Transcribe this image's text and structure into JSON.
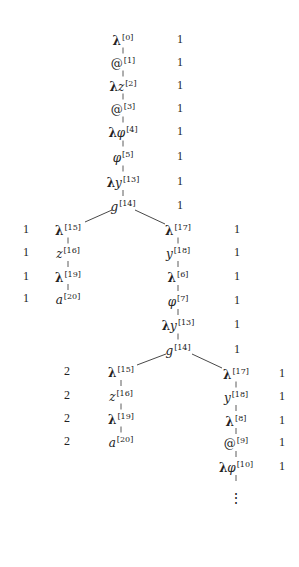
{
  "diagram": {
    "type": "tree",
    "nodes": [
      {
        "id": "n0",
        "lam": "λ",
        "sym": "",
        "idx": "[0]",
        "x": 123,
        "y": 39,
        "count": "1",
        "cx": 180
      },
      {
        "id": "n1",
        "lam": "",
        "sym": "@",
        "idx": "[1]",
        "x": 123,
        "y": 62,
        "count": "1",
        "cx": 180,
        "plain": true
      },
      {
        "id": "n2",
        "lam": "λ",
        "sym": "z",
        "idx": "[2]",
        "x": 123,
        "y": 85,
        "count": "1",
        "cx": 180
      },
      {
        "id": "n3",
        "lam": "",
        "sym": "@",
        "idx": "[3]",
        "x": 123,
        "y": 108,
        "count": "1",
        "cx": 180,
        "plain": true
      },
      {
        "id": "n4",
        "lam": "λ",
        "sym": "φ",
        "idx": "[4]",
        "x": 123,
        "y": 131,
        "count": "1",
        "cx": 180
      },
      {
        "id": "n5",
        "lam": "",
        "sym": "φ",
        "idx": "[5]",
        "x": 123,
        "y": 156,
        "count": "1",
        "cx": 180
      },
      {
        "id": "n6",
        "lam": "λ",
        "sym": "y",
        "idx": "[13]",
        "x": 123,
        "y": 181,
        "count": "1",
        "cx": 180
      },
      {
        "id": "n7",
        "lam": "",
        "sym": "g",
        "idx": "[14]",
        "x": 123,
        "y": 205,
        "count": "1",
        "cx": 180
      },
      {
        "id": "l0",
        "lam": "λ",
        "sym": "",
        "idx": "[15]",
        "x": 68,
        "y": 229,
        "count": "1",
        "cx": 26
      },
      {
        "id": "l1",
        "lam": "",
        "sym": "z",
        "idx": "[16]",
        "x": 68,
        "y": 252,
        "count": "1",
        "cx": 26
      },
      {
        "id": "l2",
        "lam": "λ",
        "sym": "",
        "idx": "[19]",
        "x": 68,
        "y": 276,
        "count": "1",
        "cx": 26
      },
      {
        "id": "l3",
        "lam": "",
        "sym": "a",
        "idx": "[20]",
        "x": 68,
        "y": 298,
        "count": "1",
        "cx": 26
      },
      {
        "id": "r0",
        "lam": "λ",
        "sym": "",
        "idx": "[17]",
        "x": 178,
        "y": 229,
        "count": "1",
        "cx": 237
      },
      {
        "id": "r1",
        "lam": "",
        "sym": "y",
        "idx": "[18]",
        "x": 178,
        "y": 252,
        "count": "1",
        "cx": 237
      },
      {
        "id": "r2",
        "lam": "λ",
        "sym": "",
        "idx": "[6]",
        "x": 178,
        "y": 276,
        "count": "1",
        "cx": 237
      },
      {
        "id": "r3",
        "lam": "",
        "sym": "φ",
        "idx": "[7]",
        "x": 178,
        "y": 300,
        "count": "1",
        "cx": 237
      },
      {
        "id": "r4",
        "lam": "λ",
        "sym": "y",
        "idx": "[13]",
        "x": 178,
        "y": 324,
        "count": "1",
        "cx": 237
      },
      {
        "id": "r5",
        "lam": "",
        "sym": "g",
        "idx": "[14]",
        "x": 178,
        "y": 349,
        "count": "1",
        "cx": 237
      },
      {
        "id": "rl0",
        "lam": "λ",
        "sym": "",
        "idx": "[15]",
        "x": 121,
        "y": 371,
        "count": "2",
        "cx": 67
      },
      {
        "id": "rl1",
        "lam": "",
        "sym": "z",
        "idx": "[16]",
        "x": 121,
        "y": 395,
        "count": "2",
        "cx": 67
      },
      {
        "id": "rl2",
        "lam": "λ",
        "sym": "",
        "idx": "[19]",
        "x": 121,
        "y": 418,
        "count": "2",
        "cx": 67
      },
      {
        "id": "rl3",
        "lam": "",
        "sym": "a",
        "idx": "[20]",
        "x": 121,
        "y": 441,
        "count": "2",
        "cx": 67
      },
      {
        "id": "rr0",
        "lam": "λ",
        "sym": "",
        "idx": "[17]",
        "x": 236,
        "y": 373,
        "count": "1",
        "cx": 282
      },
      {
        "id": "rr1",
        "lam": "",
        "sym": "y",
        "idx": "[18]",
        "x": 236,
        "y": 396,
        "count": "1",
        "cx": 282
      },
      {
        "id": "rr2",
        "lam": "λ",
        "sym": "",
        "idx": "[8]",
        "x": 236,
        "y": 420,
        "count": "1",
        "cx": 282
      },
      {
        "id": "rr3",
        "lam": "",
        "sym": "@",
        "idx": "[9]",
        "x": 236,
        "y": 442,
        "count": "1",
        "cx": 282,
        "plain": true
      },
      {
        "id": "rr4",
        "lam": "λ",
        "sym": "φ",
        "idx": "[10]",
        "x": 236,
        "y": 466,
        "count": "1",
        "cx": 282
      }
    ],
    "vertical_edges": [
      [
        "n0",
        "n1"
      ],
      [
        "n1",
        "n2"
      ],
      [
        "n2",
        "n3"
      ],
      [
        "n3",
        "n4"
      ],
      [
        "n4",
        "n5"
      ],
      [
        "n5",
        "n6"
      ],
      [
        "n6",
        "n7"
      ],
      [
        "l0",
        "l1"
      ],
      [
        "l1",
        "l2"
      ],
      [
        "l2",
        "l3"
      ],
      [
        "r0",
        "r1"
      ],
      [
        "r1",
        "r2"
      ],
      [
        "r2",
        "r3"
      ],
      [
        "r3",
        "r4"
      ],
      [
        "r4",
        "r5"
      ],
      [
        "rl0",
        "rl1"
      ],
      [
        "rl1",
        "rl2"
      ],
      [
        "rl2",
        "rl3"
      ],
      [
        "rr0",
        "rr1"
      ],
      [
        "rr1",
        "rr2"
      ],
      [
        "rr2",
        "rr3"
      ],
      [
        "rr3",
        "rr4"
      ]
    ],
    "branch_edges": [
      {
        "x1": 112,
        "y1": 210,
        "x2": 85,
        "y2": 222
      },
      {
        "x1": 135,
        "y1": 210,
        "x2": 165,
        "y2": 224
      },
      {
        "x1": 166,
        "y1": 354,
        "x2": 137,
        "y2": 365
      },
      {
        "x1": 192,
        "y1": 354,
        "x2": 222,
        "y2": 368
      }
    ],
    "continuation": {
      "symbol": "⋮",
      "x": 236,
      "y": 498
    },
    "line_color": "#333333"
  }
}
